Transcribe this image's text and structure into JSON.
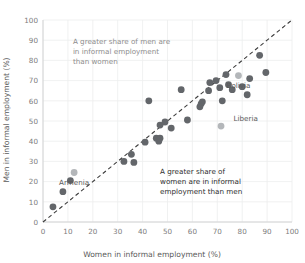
{
  "chart_data": {
    "type": "scatter",
    "title": "",
    "xlabel": "Women in informal employment (%)",
    "ylabel": "Men in informal employment (%)",
    "xlim": [
      0,
      100
    ],
    "ylim": [
      0,
      100
    ],
    "xticks": [
      0,
      10,
      20,
      30,
      40,
      50,
      60,
      70,
      80,
      90,
      100
    ],
    "yticks": [
      0,
      10,
      20,
      30,
      40,
      50,
      60,
      70,
      80,
      90,
      100
    ],
    "grid": true,
    "legend": "none",
    "reference_line": {
      "type": "identity",
      "style": "dashed",
      "from": [
        0,
        0
      ],
      "to": [
        100,
        100
      ]
    },
    "annotations": [
      {
        "name": "upper-left-note",
        "text_lines": [
          "A greater share of men are",
          "in informal employment",
          "than women"
        ],
        "color": "#8d8d8d",
        "x": 12,
        "y": 88
      },
      {
        "name": "lower-right-note",
        "text_lines": [
          "A greater share of",
          "women are in informal",
          "employment than men"
        ],
        "color": "#2e2e2e",
        "x": 47,
        "y": 24
      }
    ],
    "point_color": "#63666a",
    "highlight_color": "#b4b7ba",
    "points": [
      {
        "x": 4,
        "y": 7.5
      },
      {
        "x": 8,
        "y": 15
      },
      {
        "x": 11,
        "y": 20.5
      },
      {
        "x": 12.5,
        "y": 24.5,
        "label": "Armenia",
        "highlight": true,
        "label_dx": 0,
        "label_dy": -6
      },
      {
        "x": 32.5,
        "y": 30
      },
      {
        "x": 36.5,
        "y": 29.5
      },
      {
        "x": 35.5,
        "y": 33.5
      },
      {
        "x": 41,
        "y": 39.5
      },
      {
        "x": 42.5,
        "y": 60
      },
      {
        "x": 45.5,
        "y": 41.5
      },
      {
        "x": 46.5,
        "y": 40
      },
      {
        "x": 47,
        "y": 41.5
      },
      {
        "x": 47,
        "y": 48
      },
      {
        "x": 49,
        "y": 49.5
      },
      {
        "x": 51.5,
        "y": 46.5
      },
      {
        "x": 55.5,
        "y": 65.5
      },
      {
        "x": 58,
        "y": 50.5
      },
      {
        "x": 63,
        "y": 57
      },
      {
        "x": 63.5,
        "y": 58.5
      },
      {
        "x": 64,
        "y": 59.5
      },
      {
        "x": 66.5,
        "y": 65
      },
      {
        "x": 67,
        "y": 69
      },
      {
        "x": 69.5,
        "y": 70
      },
      {
        "x": 71,
        "y": 66.5
      },
      {
        "x": 72,
        "y": 60
      },
      {
        "x": 71.5,
        "y": 47.5,
        "label": "Liberia",
        "highlight": true,
        "label_dx": 5,
        "label_dy": 2.5
      },
      {
        "x": 73.5,
        "y": 73
      },
      {
        "x": 74.5,
        "y": 68
      },
      {
        "x": 76,
        "y": 65.5
      },
      {
        "x": 78.5,
        "y": 72.5,
        "label": "Bolivia",
        "highlight": true,
        "label_dx": 0,
        "label_dy": -6
      },
      {
        "x": 80,
        "y": 67
      },
      {
        "x": 82,
        "y": 63
      },
      {
        "x": 83,
        "y": 71
      },
      {
        "x": 87,
        "y": 82.5
      },
      {
        "x": 89.5,
        "y": 74
      }
    ]
  }
}
